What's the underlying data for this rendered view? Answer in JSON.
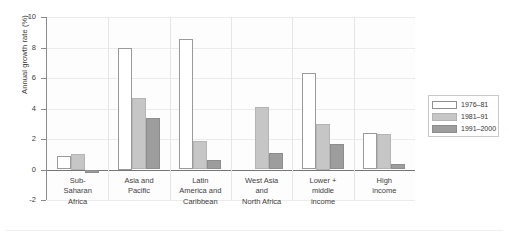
{
  "chart_data": {
    "type": "bar",
    "title": "",
    "xlabel": "",
    "ylabel": "Annual growth rate (%)",
    "ylim": [
      -2,
      10
    ],
    "yticks": [
      10,
      8,
      6,
      4,
      2,
      0,
      -2
    ],
    "ytick_labels": [
      "10",
      "8",
      "6",
      "4",
      "2",
      "0",
      "-2"
    ],
    "grid": true,
    "legend_position": "right",
    "categories": [
      "Sub-\nSaharan\nAfrica",
      "Asia and\nPacific",
      "Latin\nAmerica and\nCaribbean",
      "West Asia\nand\nNorth Africa",
      "Lower +\nmiddle\nincome",
      "High\nincome"
    ],
    "series": [
      {
        "name": "1976–81",
        "color": "#ffffff",
        "values": [
          0.9,
          8.0,
          8.55,
          0.0,
          6.3,
          2.4
        ]
      },
      {
        "name": "1981–91",
        "color": "#c6c6c6",
        "values": [
          1.0,
          4.7,
          1.85,
          4.1,
          3.0,
          2.35
        ]
      },
      {
        "name": "1991–2000",
        "color": "#9d9d9d",
        "values": [
          -0.25,
          3.35,
          0.6,
          1.1,
          1.7,
          0.35
        ]
      }
    ]
  },
  "legend": {
    "items": [
      {
        "label": "1976–81"
      },
      {
        "label": "1981–91"
      },
      {
        "label": "1991–2000"
      }
    ]
  }
}
